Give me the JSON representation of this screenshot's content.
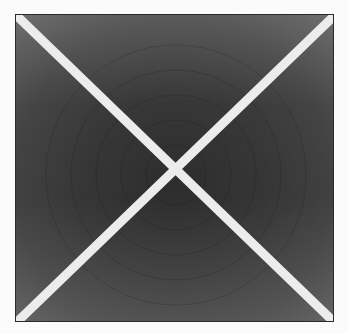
{
  "image": {
    "description": "Dark textured square panel crossed by a white X",
    "background_color": "#fbfbfb",
    "panel_color": "#3a3a3a",
    "cross_color": "#ececec",
    "cross_stroke_width": 9
  }
}
